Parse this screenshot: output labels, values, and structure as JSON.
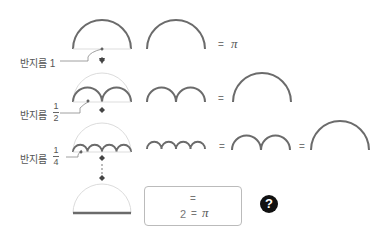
{
  "diagram": {
    "rows": [
      {
        "label": "반지름",
        "radius": "1",
        "equals": "=",
        "result": "π"
      },
      {
        "label": "반지름",
        "radius_num": "1",
        "radius_den": "2",
        "equals": "="
      },
      {
        "label": "반지름",
        "radius_num": "1",
        "radius_den": "4",
        "equals_1": "=",
        "equals_2": "="
      }
    ],
    "box": {
      "line1_equals": "=",
      "line2_value": "2",
      "line2_equals": "=",
      "line2_result": "π"
    },
    "question_mark": "?",
    "colors": {
      "arc": "#6b6b6b",
      "guide": "#d8d8d8",
      "badge": "#111111"
    }
  }
}
